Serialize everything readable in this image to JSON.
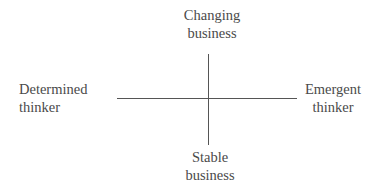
{
  "diagram": {
    "type": "quadrant-axes",
    "axes": {
      "vertical": {
        "top_label": [
          "Changing",
          "business"
        ],
        "bottom_label": [
          "Stable",
          "business"
        ]
      },
      "horizontal": {
        "left_label": [
          "Determined",
          "thinker"
        ],
        "right_label": [
          "Emergent",
          "thinker"
        ]
      }
    },
    "colors": {
      "line": "#555555",
      "text": "#4a4a4a",
      "background": "#ffffff"
    }
  }
}
